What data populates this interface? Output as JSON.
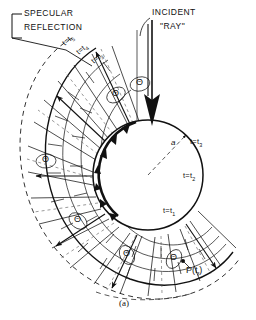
{
  "figure": {
    "caption": "(a)",
    "radius_label": "a"
  },
  "annotations": {
    "specular_line1": "SPECULAR",
    "specular_line2": "REFLECTION",
    "incident_line1": "INCIDENT",
    "incident_line2": "\"RAY\""
  },
  "time_labels_fan": [
    {
      "base": "t",
      "eq": "=",
      "sym": "t",
      "sub": "5"
    },
    {
      "base": "t",
      "eq": "=",
      "sym": "t",
      "sub": "4"
    },
    {
      "base": "t",
      "eq": "=",
      "sym": "t",
      "sub": "3"
    }
  ],
  "time_labels_right": [
    {
      "base": "t",
      "eq": "=",
      "sym": "t",
      "sub": "3"
    },
    {
      "base": "t",
      "eq": "=",
      "sym": "t",
      "sub": "2"
    },
    {
      "base": "t",
      "eq": "=",
      "sym": "t",
      "sub": "1"
    }
  ],
  "point_label": {
    "name": "P",
    "open": "(",
    "sym": "t",
    "sub": "f",
    "close": ")"
  },
  "angle_symbol": "Θ",
  "angle_marks_count": 6,
  "colors": {
    "ink": "#111111",
    "paper": "#ffffff",
    "dashed": "#333333"
  },
  "geometry": {
    "sphere_center_x": 148,
    "sphere_center_y": 175,
    "sphere_radius": 55,
    "incident_ray_x": 152,
    "note": "wavefront fan sweeps counter-clockwise from top around the left side to bottom"
  }
}
